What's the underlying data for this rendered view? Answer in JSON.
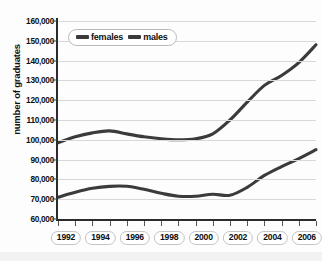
{
  "chart": {
    "ylabel": "number of graduates",
    "ghost_title_text": "",
    "legend": {
      "position": "top-left-inside",
      "entries": [
        {
          "label": "females",
          "color": "#3b3b3b"
        },
        {
          "label": "males",
          "color": "#3b3b3b"
        }
      ]
    }
  },
  "chart_data": {
    "type": "line",
    "title": "",
    "xlabel": "",
    "ylabel": "number of graduates",
    "grid": true,
    "legend_position": "top-left-inside",
    "xlim": [
      1992,
      2007
    ],
    "ylim": [
      60000,
      160000
    ],
    "x": [
      1992,
      1993,
      1994,
      1995,
      1996,
      1997,
      1998,
      1999,
      2000,
      2001,
      2002,
      2003,
      2004,
      2005,
      2006,
      2007
    ],
    "xtick_labels": [
      "1992",
      "1994",
      "1996",
      "1998",
      "2000",
      "2002",
      "2004",
      "2006"
    ],
    "xtick_values": [
      1992,
      1994,
      1996,
      1998,
      2000,
      2002,
      2004,
      2006
    ],
    "ytick_labels": [
      "60,000",
      "70,000",
      "80,000",
      "90,000",
      "100,000",
      "110,000",
      "120,000",
      "130,000",
      "140,000",
      "150,000",
      "160,000"
    ],
    "ytick_values": [
      60000,
      70000,
      80000,
      90000,
      100000,
      110000,
      120000,
      130000,
      140000,
      150000,
      160000
    ],
    "series": [
      {
        "name": "females",
        "color": "#3b3b3b",
        "values": [
          98500,
          101500,
          103500,
          104500,
          103000,
          101500,
          100500,
          100000,
          100500,
          103000,
          110000,
          119000,
          127500,
          132500,
          139000,
          148000
        ]
      },
      {
        "name": "males",
        "color": "#3b3b3b",
        "values": [
          71000,
          73500,
          75500,
          76500,
          76500,
          75000,
          73000,
          71500,
          71500,
          72500,
          72000,
          76000,
          82000,
          86500,
          90500,
          95000
        ]
      }
    ]
  }
}
